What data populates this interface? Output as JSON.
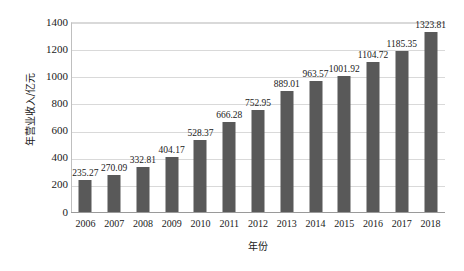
{
  "chart_data": {
    "type": "bar",
    "title": "",
    "xlabel": "年份",
    "ylabel": "年营业收入/亿元",
    "categories": [
      "2006",
      "2007",
      "2008",
      "2009",
      "2010",
      "2011",
      "2012",
      "2013",
      "2014",
      "2015",
      "2016",
      "2017",
      "2018"
    ],
    "values": [
      235.27,
      270.09,
      332.81,
      404.17,
      528.37,
      666.28,
      752.95,
      889.01,
      963.57,
      1001.92,
      1104.72,
      1185.35,
      1323.81
    ],
    "data_labels": [
      "235.27",
      "270.09",
      "332.81",
      "404.17",
      "528.37",
      "666.28",
      "752.95",
      "889.01",
      "963.57",
      "1001.92",
      "1104.72",
      "1185.35",
      "1323.81"
    ],
    "ylim": [
      0,
      1400
    ],
    "ytick_values": [
      0,
      200,
      400,
      600,
      800,
      1000,
      1200,
      1400
    ],
    "ytick_labels": [
      "0",
      "200",
      "400",
      "600",
      "800",
      "1000",
      "1200",
      "1400"
    ],
    "grid": true,
    "legend": false,
    "series_name": "年营业收入",
    "bar_color": "#595959",
    "gridline_color": "#d9d9d9",
    "background_color": "#ffffff",
    "axis_color": "#9a9a9a"
  }
}
